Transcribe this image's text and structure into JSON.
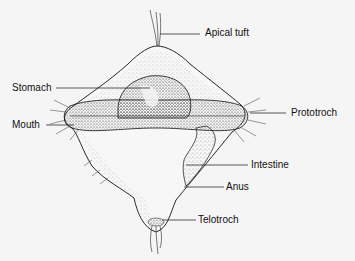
{
  "labels": {
    "apical_tuft": "Apical tuft",
    "stomach": "Stomach",
    "mouth": "Mouth",
    "prototroch": "Prototroch",
    "intestine": "Intestine",
    "anus": "Anus",
    "telotroch": "Telotroch"
  },
  "colors": {
    "background": "#f5f5f5",
    "ink": "#111111",
    "stipple": "#555555"
  }
}
